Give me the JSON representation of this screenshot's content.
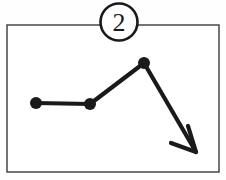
{
  "canvas": {
    "width": 226,
    "height": 180,
    "background_color": "#fefefe"
  },
  "frame": {
    "label": "diagram-frame",
    "x": 7,
    "y": 25,
    "width": 212,
    "height": 147,
    "stroke_color": "#3a3a3a",
    "stroke_width": 1.4,
    "fill_color": "#ffffff"
  },
  "badge": {
    "label": "step-number-badge",
    "text": "2",
    "center_x": 119,
    "center_y": 22,
    "radius": 18.5,
    "stroke_color": "#1a1a1a",
    "stroke_width": 2.6,
    "fill_color": "#ffffff",
    "text_color": "#1a1a1a",
    "font_size": 26
  },
  "chart_data": {
    "type": "line",
    "title": "",
    "subtitle": "",
    "xlabel": "",
    "ylabel": "",
    "grid": false,
    "legend": null,
    "stroke_color": "#1a1a1a",
    "stroke_width": 4.2,
    "marker_color": "#1a1a1a",
    "marker_radius": 6,
    "axis_hidden": true,
    "xlim": [
      0,
      226
    ],
    "ylim": [
      180,
      0
    ],
    "x": [
      36,
      90,
      144,
      196
    ],
    "y": [
      103,
      104,
      63,
      152
    ],
    "values": [
      103,
      104,
      63,
      152
    ],
    "categories": [
      "p1",
      "p2",
      "p3",
      "arrow-tip"
    ],
    "points": [
      {
        "name": "point-1",
        "x": 36,
        "y": 103,
        "marker": true
      },
      {
        "name": "point-2",
        "x": 90,
        "y": 104,
        "marker": true
      },
      {
        "name": "point-3-peak",
        "x": 144,
        "y": 63,
        "marker": true
      },
      {
        "name": "arrow-tip",
        "x": 196,
        "y": 152,
        "marker": false
      }
    ],
    "annotations": [
      {
        "name": "end-arrowhead",
        "type": "arrowhead",
        "tip_x": 196,
        "tip_y": 152,
        "direction": "down-right",
        "barb_left_x": 171,
        "barb_left_y": 143,
        "barb_up_x": 188,
        "barb_up_y": 126
      }
    ]
  }
}
